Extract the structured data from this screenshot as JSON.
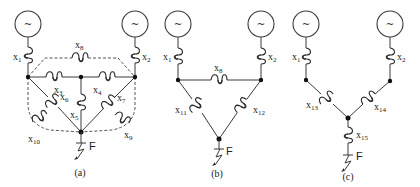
{
  "figure": {
    "panels": [
      {
        "caption": "(a)",
        "generators": [
          {
            "symbol": "~"
          },
          {
            "symbol": "~"
          }
        ],
        "reactances": [
          "x1",
          "x2",
          "x3",
          "x4",
          "x5",
          "x6",
          "x7",
          "x8",
          "x9",
          "x10"
        ],
        "fault_label": "F"
      },
      {
        "caption": "(b)",
        "generators": [
          {
            "symbol": "~"
          },
          {
            "symbol": "~"
          }
        ],
        "reactances": [
          "x1",
          "x2",
          "x8",
          "x11",
          "x12"
        ],
        "fault_label": "F"
      },
      {
        "caption": "(c)",
        "generators": [
          {
            "symbol": "~"
          },
          {
            "symbol": "~"
          }
        ],
        "reactances": [
          "x1",
          "x2",
          "x13",
          "x14",
          "x15"
        ],
        "fault_label": "F"
      }
    ]
  },
  "labels": {
    "x": "x",
    "s1": "1",
    "s2": "2",
    "s3": "3",
    "s4": "4",
    "s5": "5",
    "s6": "6",
    "s7": "7",
    "s8": "8",
    "s9": "9",
    "s10": "10",
    "s11": "11",
    "s12": "12",
    "s13": "13",
    "s14": "14",
    "s15": "15",
    "tilde": "~",
    "F": "F",
    "cap_a": "(a)",
    "cap_b": "(b)",
    "cap_c": "(c)"
  }
}
